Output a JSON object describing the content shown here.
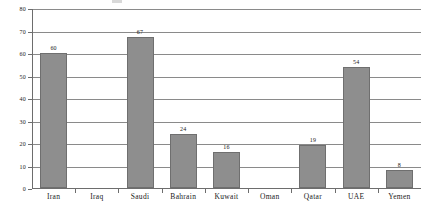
{
  "chart_data": {
    "type": "bar",
    "title": "",
    "subtitle": "",
    "xlabel": "",
    "ylabel": "",
    "categories": [
      "Iran",
      "Iraq",
      "Saudi",
      "Bahrain",
      "Kuwait",
      "Oman",
      "Qatar",
      "UAE",
      "Yemen"
    ],
    "values": [
      60,
      null,
      67,
      24,
      16,
      null,
      19,
      54,
      8
    ],
    "value_labels": [
      "60",
      "",
      "67",
      "24",
      "16",
      "",
      "19",
      "54",
      "8"
    ],
    "ylim": [
      0,
      80
    ],
    "ytick_labels": [
      "0",
      "10",
      "20",
      "30",
      "40",
      "50",
      "60",
      "70",
      "80"
    ],
    "ytick_values": [
      0,
      10,
      20,
      30,
      40,
      50,
      60,
      70,
      80
    ],
    "grid": true,
    "legend": "none",
    "bar_color": "#8e8e8e",
    "bar_edge_color": "#6f6f6f",
    "axis_color": "#6d6d6d",
    "grid_color": "#8a8a8a",
    "background": "#ffffff"
  }
}
